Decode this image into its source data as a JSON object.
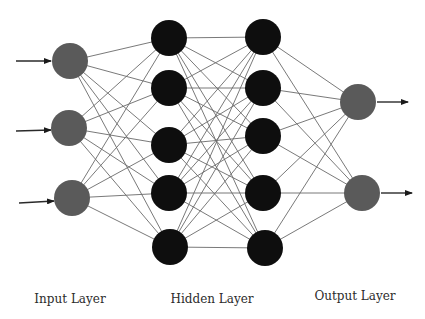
{
  "diagram": {
    "colors": {
      "background": "#ffffff",
      "io_node": "#5a5a5a",
      "hidden_node": "#0e0e0e",
      "edge": "#6a6a6a",
      "arrow": "#2a2a2a"
    },
    "node_radius": 18,
    "layers": [
      {
        "id": "input",
        "label": "Input Layer",
        "type": "io",
        "label_pos": {
          "x": 70,
          "y": 292
        },
        "nodes": [
          {
            "x": 70,
            "y": 61
          },
          {
            "x": 69,
            "y": 128
          },
          {
            "x": 72,
            "y": 198
          }
        ]
      },
      {
        "id": "hidden1",
        "label": "Hidden Layer",
        "type": "hidden",
        "label_pos": {
          "x": 212,
          "y": 292
        },
        "nodes": [
          {
            "x": 169,
            "y": 38
          },
          {
            "x": 169,
            "y": 88
          },
          {
            "x": 169,
            "y": 145
          },
          {
            "x": 169,
            "y": 193
          },
          {
            "x": 170,
            "y": 247
          }
        ]
      },
      {
        "id": "hidden2",
        "label": "",
        "type": "hidden",
        "nodes": [
          {
            "x": 263,
            "y": 37
          },
          {
            "x": 263,
            "y": 88
          },
          {
            "x": 263,
            "y": 136
          },
          {
            "x": 263,
            "y": 193
          },
          {
            "x": 265,
            "y": 248
          }
        ]
      },
      {
        "id": "output",
        "label": "Output Layer",
        "type": "io",
        "label_pos": {
          "x": 355,
          "y": 289
        },
        "nodes": [
          {
            "x": 358,
            "y": 102
          },
          {
            "x": 362,
            "y": 193
          }
        ]
      }
    ],
    "connections": "fully-connected",
    "input_arrows": [
      {
        "x1": 16,
        "y1": 61,
        "x2": 51,
        "y2": 61
      },
      {
        "x1": 16,
        "y1": 131,
        "x2": 51,
        "y2": 130
      },
      {
        "x1": 19,
        "y1": 203,
        "x2": 54,
        "y2": 201
      }
    ],
    "output_arrows": [
      {
        "x1": 377,
        "y1": 102,
        "x2": 408,
        "y2": 102
      },
      {
        "x1": 381,
        "y1": 193,
        "x2": 412,
        "y2": 193
      }
    ],
    "labels": {
      "input": "Input Layer",
      "hidden": "Hidden Layer",
      "output": "Output Layer"
    }
  }
}
